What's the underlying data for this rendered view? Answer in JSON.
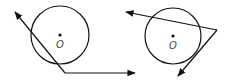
{
  "figures": [
    {
      "id": "left",
      "center_label": "O",
      "description": "Circle with tangent-secant angle: tangent line and secant from point on circle"
    },
    {
      "id": "right",
      "center_label": "O",
      "description": "Circle with external point: secant and tangent from external vertex"
    }
  ],
  "colors": {
    "stroke": "#111111",
    "background": "#ffffff"
  }
}
